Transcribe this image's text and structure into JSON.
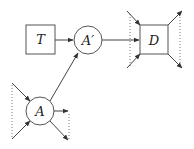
{
  "diagram": {
    "nodes": [
      {
        "id": "T",
        "label": "T",
        "shape": "square"
      },
      {
        "id": "A_prime",
        "label": "A′",
        "shape": "circle"
      },
      {
        "id": "D",
        "label": "D",
        "shape": "square"
      },
      {
        "id": "A",
        "label": "A",
        "shape": "circle"
      }
    ],
    "edges": [
      {
        "from": "T",
        "to": "A_prime"
      },
      {
        "from": "A",
        "to": "A_prime"
      },
      {
        "from": "A_prime",
        "to": "D"
      }
    ],
    "colors": {
      "stroke": "#444444",
      "dotted": "#777777",
      "background": "#ffffff"
    }
  }
}
